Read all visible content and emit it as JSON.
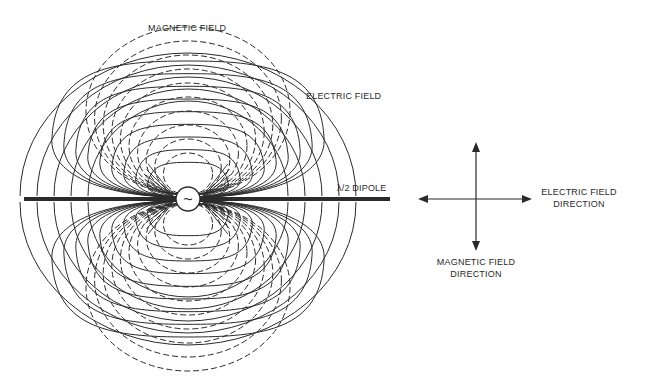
{
  "diagram": {
    "labels": {
      "magnetic_field": "MAGNETIC FIELD",
      "electric_field": "ELECTRIC FIELD",
      "dipole": "λ/2 DIPOLE",
      "source_symbol": "~",
      "electric_direction_line1": "ELECTRIC FIELD",
      "electric_direction_line2": "DIRECTION",
      "magnetic_direction_line1": "MAGNETIC FIELD",
      "magnetic_direction_line2": "DIRECTION"
    },
    "legend": {
      "electric_field_style": "solid",
      "magnetic_field_style": "dashed"
    },
    "electric_field_lobe_count_per_side": 9,
    "magnetic_field_loop_count_per_side": 10,
    "colors": {
      "line": "#2b2b2b",
      "background": "#ffffff"
    }
  }
}
